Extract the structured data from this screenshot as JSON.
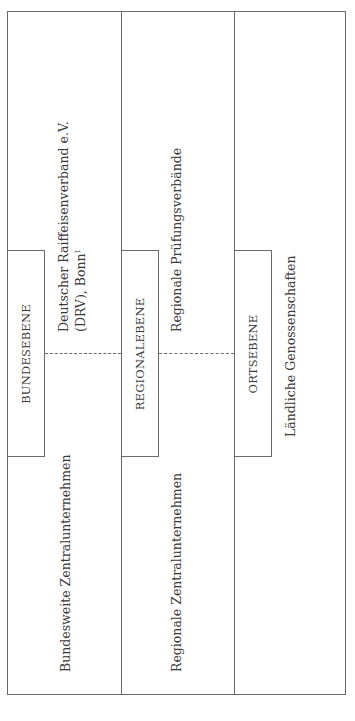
{
  "diagram": {
    "type": "hierarchical-organization-chart",
    "orientation": "rotated-90-ccw",
    "levels": [
      {
        "label": "BUNDESEBENE",
        "association_line1": "Deutscher Raiffeisenverband e.V.",
        "association_line2": "(DRV), Bonn",
        "association_footnote": "1",
        "enterprises": "Bundesweite Zentralunternehmen"
      },
      {
        "label": "REGIONALEBENE",
        "association_line1": "Regionale Prüfungsverbände",
        "enterprises": "Regionale Zentralunternehmen"
      },
      {
        "label": "ORTSEBENE",
        "association_line1": "Ländliche Genossenschaften"
      }
    ],
    "colors": {
      "line": "#6a6a6a",
      "text": "#3a3a3a",
      "background": "#ffffff"
    }
  }
}
